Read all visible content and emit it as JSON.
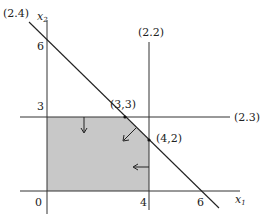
{
  "diagram": {
    "type": "linear-programming-feasible-region",
    "axes": {
      "x_label": "x",
      "x_sub": "1",
      "y_label": "x",
      "y_sub": "2",
      "origin_label": "0",
      "x_ticks": [
        "4",
        "6"
      ],
      "y_ticks": [
        "6",
        "3"
      ]
    },
    "constraints": [
      {
        "id": "2.2",
        "label": "(2.2)",
        "equation": "x1 = 4"
      },
      {
        "id": "2.3",
        "label": "(2.3)",
        "equation": "x2 = 3"
      },
      {
        "id": "2.4",
        "label": "(2.4)",
        "equation": "x1 + x2 = 6"
      }
    ],
    "vertices": [
      {
        "label": "(3,3)"
      },
      {
        "label": "(4,2)"
      }
    ],
    "colors": {
      "feasible_region": "#c8c8c8",
      "lines": "#222222"
    }
  }
}
